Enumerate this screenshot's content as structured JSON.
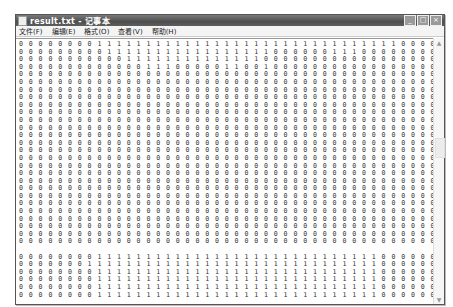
{
  "window": {
    "title": "result.txt - 记事本",
    "controls": {
      "minimize": "_",
      "maximize": "□",
      "close": "×"
    }
  },
  "menubar": {
    "items": [
      {
        "label": "文件(F)"
      },
      {
        "label": "编辑(E)"
      },
      {
        "label": "格式(O)"
      },
      {
        "label": "查看(V)"
      },
      {
        "label": "帮助(H)"
      }
    ]
  },
  "editor": {
    "content_top": [
      "0 0 0 0 0 0 0 0 1 1 1 1 1 1 1 1 1 1 1 1 1 1 1 1 1 1 1 1 1 1 1 1 1 1 1 1 1 1 1 0 0 0 0 0 0 0 0 0 0 0 0 0 0 0 0 0",
      "0 0 0 0 0 0 0 0 0 1 1 1 1 1 1 1 1 1 1 1 1 1 1 1 1 1 0 0 0 0 0 0 1 1 1 0 0 0 0 0 0 0 0 0 0 0 0 0 0 0 0 0 0 0 0 0",
      "0 0 0 0 0 0 0 0 0 0 0 1 1 1 1 1 1 1 1 1 1 1 1 1 1 0 0 0 0 0 0 0 0 0 0 0 0 0 0 0 0 0 0 0 0 0 0 0 0 0 0 0 0 0 0 0",
      "0 0 0 0 0 0 0 0 0 0 0 0 0 1 1 1 0 0 0 0 0 1 1 0 0 1 0 0 0 0 0 0 0 0 0 0 0 0 0 0 0 0 0 0 0 0 0 0 0 0 0 0 0 0 0 0",
      "0 0 0 0 0 0 0 0 0 0 0 0 0 0 0 0 0 0 0 0 0 0 0 0 0 0 0 0 0 0 0 0 0 0 0 0 0 0 0 0 0 0 0 0 0 0 0 0 0 0 0 0 0 0 0 0",
      "0 0 0 0 0 0 0 0 0 0 0 0 0 0 0 0 0 0 0 0 0 0 0 0 0 0 0 0 0 0 0 0 0 0 0 0 0 0 0 0 0 0 0 0 0 0 0 0 0 0 0 0 0 0 0 0",
      "0 0 0 0 0 0 0 0 0 0 0 0 0 0 0 0 0 0 0 0 0 0 0 0 0 0 0 0 0 0 0 0 0 0 0 0 0 0 0 0 0 0 0 0 0 0 0 0 0 0 0 0 0 0 0 0",
      "0 0 0 0 0 0 0 0 0 0 0 0 0 0 0 0 0 0 0 0 0 0 0 0 0 0 0 0 0 0 0 0 0 0 0 0 0 0 0 0 0 0 0 0 0 0 0 0 0 0 0 0 0 0 0 0",
      "0 0 0 0 0 0 0 0 0 0 0 0 0 0 0 0 0 0 0 0 0 0 0 0 0 0 0 0 0 0 0 0 0 0 0 0 0 0 0 0 0 0 0 0 0 0 0 0 0 0 0 0 0 0 0 0",
      "0 0 0 0 0 0 0 0 0 0 0 0 0 0 0 0 0 0 0 0 0 0 0 0 0 0 0 0 0 0 0 0 0 0 0 0 0 0 0 0 0 0 0 0 0 0 0 0 0 0 0 0 0 0 0 0",
      "0 0 0 0 0 0 0 0 0 0 0 0 0 0 0 0 0 0 0 0 0 0 0 0 0 0 0 0 0 0 0 0 0 0 0 0 0 0 0 0 0 0 0 0 0 0 0 0 0 0 0 0 0 0 0 0",
      "0 0 0 0 0 0 0 0 0 0 0 0 0 0 0 0 0 0 0 0 0 0 0 0 0 0 0 0 0 0 0 0 0 0 0 0 0 0 0 0 0 0 0 0 0 0 0 0 0 0 0 0 0 0 0 0",
      "0 0 0 0 0 0 0 0 0 0 0 0 0 0 0 0 0 0 0 0 0 0 0 0 0 0 0 0 0 0 0 0 0 0 0 0 0 0 0 0 0 0 0 0 0 0 0 0 0 0 0 0 0 0 0 0",
      "0 0 0 0 0 0 0 0 0 0 0 0 0 0 0 0 0 0 0 0 0 0 0 0 0 0 0 0 0 0 0 0 0 0 0 0 0 0 0 0 0 0 0 0 0 0 0 0 0 0 0 0 0 0 0 0",
      "0 0 0 0 0 0 0 0 0 0 0 0 0 0 0 0 0 0 0 0 0 0 0 0 0 0 0 0 0 0 0 0 0 0 0 0 0 0 0 0 0 0 0 0 0 0 0 0 0 0 0 0 0 0 0 0",
      "0 0 0 0 0 0 0 0 0 0 0 0 0 0 0 0 0 0 0 0 0 0 0 0 0 0 0 0 0 0 0 0 0 0 0 0 0 0 0 0 0 0 0 0 0 0 0 0 0 0 0 0 0 0 0 0",
      "0 0 0 0 0 0 0 0 0 0 0 0 0 0 0 0 0 0 0 0 0 0 0 0 0 0 0 0 0 0 0 0 0 0 0 0 0 0 0 0 0 0 0 0 0 0 0 0 0 0 0 0 0 0 0 0",
      "0 0 0 0 0 0 0 0 0 0 0 0 0 0 0 0 0 0 0 0 0 0 0 0 0 0 0 0 0 0 0 0 0 0 0 0 0 0 0 0 0 0 0 0 0 0 0 0 0 0 0 0 0 0 0 0",
      "0 0 0 0 0 0 0 0 0 0 0 0 0 0 0 0 0 0 0 0 0 0 0 0 0 0 0 0 0 0 0 0 0 0 0 0 0 0 0 0 0 0 0 0 0 0 0 0 0 0 0 0 0 0 0 0",
      "0 0 0 0 0 0 0 0 0 0 0 0 0 0 0 0 0 0 0 0 0 0 0 0 0 0 0 0 0 0 0 0 0 0 0 0 0 0 0 0 0 0 0 0 0 0 0 0 0 0 0 0 0 0 0 0",
      "0 0 0 0 0 0 0 0 0 0 0 0 0 0 0 0 0 0 0 0 0 0 0 0 0 0 0 0 0 0 0 0 0 0 0 0 0 0 0 0 0 0 0 0 0 0 0 0 0 0 0 0 0 0 0 0",
      "0 0 0 0 0 0 0 0 0 0 0 0 0 0 0 0 0 0 0 0 0 0 0 0 0 0 0 0 0 0 0 0 0 0 0 0 0 0 0 0 0 0 0 0 0 0 0 0 0 0 0 0 0 0 0 0",
      "0 0 0 0 0 0 0 0 0 0 0 0 0 0 0 0 0 0 0 0 0 0 0 0 0 0 0 0 0 0 0 0 0 0 0 0 0 0 0 0 0 0 0 0 0 0 0 0 0 0 0 0 0 0 0 0",
      "0 0 0 0 0 0 0 0 0 0 0 0 0 0 0 0 0 0 0 0 0 0 0 0 0 0 0 0 0 0 0 0 0 0 0 0 0 0 0 0 0 0 0 0 0 0 0 0 0 0 0 0 0 0 0 0",
      "0 0 0 0 0 0 0 0 0 0 0 0 0 0 0 0 0 0 0 0 0 0 0 0 0 0 0 0 0 0 0 0 0 0 0 0 0 0 0 0 0 0 0 0 0 0 0 0 0 0 0 0 0 0 0 0",
      "0 0 0 0 0 0 0 0 0 0 0 0 0 0 0 0 0 0 0 0 0 0 0 0 0 0 0 0 0 0 0 0 0 0 0 0 0 0 0 0 0 0 0 0 0 0 0 0 0 0 0 0 0 0 0 0",
      "0 0 0 0 0 0 0 0 0 0 0 0 0 0 0 0 0 0 0 0 0 0 0 0 0 0 0 0 0 0 0 0 0 0 0 0 0 0 0 0 0 0 0 0 0 0 0 0 0 0 0 0 0 0 0 0"
    ],
    "content_bottom": [
      "0 0 0 0 0 0 0 0 1 1 1 1 1 1 1 1 1 1 1 1 1 1 1 1 1 1 1 1 1 1 1 1 1 1 1 1 1 0 0 0 0 0 0 0 0 0 0 0 0 0 0 0 0 0 0 0",
      "0 0 0 0 0 0 0 1 1 1 1 1 1 1 1 1 1 1 1 1 1 1 1 1 1 1 1 1 1 1 1 1 1 1 1 1 1 0 0 0 0 0 0 0 0 0 0 0 0 0 0 0 0 0 0 0",
      "0 0 0 0 0 0 0 0 1 1 1 1 1 1 1 1 1 1 1 1 1 1 1 1 1 1 1 1 1 1 1 1 1 1 1 1 1 0 0 0 0 0 0 0 0 0 0 0 0 0 0 0 0 0 0 0",
      "0 0 0 0 0 0 0 0 1 1 1 1 1 1 1 1 1 1 1 1 1 1 1 1 1 1 1 1 1 1 1 1 1 1 1 1 1 0 0 0 0 0 0 0 0 0 0 0 0 0 0 0 0 0 0 0",
      "0 0 0 0 0 0 0 0 1 1 1 1 1 1 1 1 1 1 1 1 1 1 1 1 1 1 1 1 1 1 1 1 1 1 1 1 1 0 0 0 0 0 0 0 0 0 0 0 0 0 0 0 0 0 0 0",
      "0 0 0 0 0 0 0 0 1 1 1 1 1 1 1 1 1 1 1 1 1 1 1 1 1 1 1 1 1 1 1 1 1 1 1 1 1 0 0 0 0 0 0 0 0 0 0 0 0 0 0 0 0 0 0 0"
    ]
  },
  "scrollbar": {
    "up": "▲",
    "down": "▼"
  }
}
